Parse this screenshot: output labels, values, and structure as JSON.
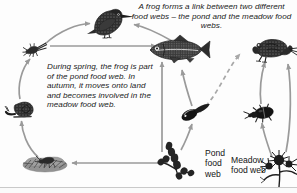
{
  "figure": {
    "title_note": "A frog forms a link between two different food webs – the pond and the meadow food webs.",
    "body_note": "During spring, the frog is part of the pond food web. In autumn, it moves onto land and becomes involved in the meadow food web.",
    "labels": {
      "pond": "Pond food web",
      "pond_lines": [
        "Pond",
        "food",
        "web"
      ],
      "meadow": "Meadow food web",
      "meadow_lines": [
        "Meadow",
        "food web"
      ]
    },
    "colors": {
      "arrow": "#9a9a9a",
      "arrow_dashed": "#a8a8a8",
      "text": "#1b1b1b",
      "organism": "#2a2a2a",
      "background": "#fdfdfd",
      "baseline": "#c9c9c9"
    },
    "organisms": [
      {
        "id": "mayfly-nymph",
        "name": "Mayfly nymph",
        "web": "pond",
        "x": 33,
        "y": 50
      },
      {
        "id": "kingfisher",
        "name": "Kingfisher",
        "web": "pond",
        "x": 107,
        "y": 25
      },
      {
        "id": "fish",
        "name": "Fish",
        "web": "pond",
        "x": 176,
        "y": 50
      },
      {
        "id": "snail",
        "name": "Pond snail",
        "web": "pond",
        "x": 22,
        "y": 108
      },
      {
        "id": "detritus",
        "name": "Pond detritus",
        "web": "pond",
        "x": 45,
        "y": 163
      },
      {
        "id": "pond-plant",
        "name": "Pond plant",
        "web": "pond",
        "x": 175,
        "y": 160
      },
      {
        "id": "tadpole",
        "name": "Tadpole",
        "web": "pond",
        "x": 193,
        "y": 113
      },
      {
        "id": "frog",
        "name": "Frog",
        "web": "meadow",
        "x": 272,
        "y": 50
      },
      {
        "id": "beetle",
        "name": "Beetle",
        "web": "meadow",
        "x": 262,
        "y": 113
      },
      {
        "id": "thistle",
        "name": "Meadow thistle",
        "web": "meadow",
        "x": 281,
        "y": 167
      }
    ],
    "links": [
      {
        "from": "mayfly-nymph",
        "to": "kingfisher",
        "style": "solid"
      },
      {
        "from": "mayfly-nymph",
        "to": "fish",
        "style": "solid"
      },
      {
        "from": "fish",
        "to": "kingfisher",
        "style": "solid"
      },
      {
        "from": "detritus",
        "to": "snail",
        "style": "solid"
      },
      {
        "from": "snail",
        "to": "mayfly-nymph",
        "style": "solid"
      },
      {
        "from": "pond-plant",
        "to": "detritus",
        "style": "solid"
      },
      {
        "from": "pond-plant",
        "to": "fish",
        "style": "solid"
      },
      {
        "from": "pond-plant",
        "to": "tadpole",
        "style": "solid"
      },
      {
        "from": "tadpole",
        "to": "fish",
        "style": "solid"
      },
      {
        "from": "tadpole",
        "to": "frog",
        "style": "dashed"
      },
      {
        "from": "thistle",
        "to": "beetle",
        "style": "solid"
      },
      {
        "from": "beetle",
        "to": "frog",
        "style": "solid"
      },
      {
        "from": "thistle",
        "to": "frog",
        "style": "solid"
      }
    ]
  }
}
